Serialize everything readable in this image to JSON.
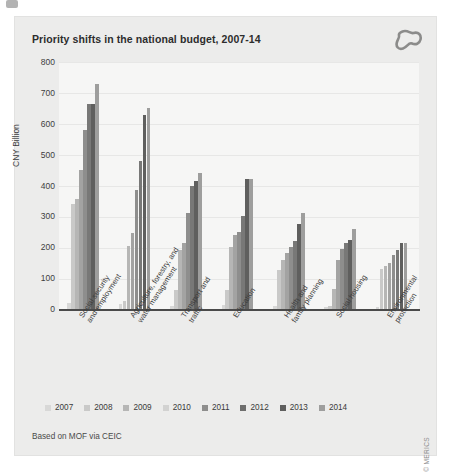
{
  "figure": {
    "title": "Priority shifts in the national budget, 2007-14",
    "source_note": "Based on MOF via CEIC",
    "copyright": "© MERICS",
    "logo_name": "merics-logo"
  },
  "chart_data": {
    "type": "bar",
    "title": "Priority shifts in the national budget, 2007-14",
    "xlabel": "",
    "ylabel": "CNY Billion",
    "ylim": [
      0,
      800
    ],
    "yticks": [
      0,
      100,
      200,
      300,
      400,
      500,
      600,
      700,
      800
    ],
    "grid": true,
    "legend_position": "bottom",
    "categories": [
      "Social security and employment",
      "Agriculture, forestry, and water management",
      "Transport and traffic",
      "Education",
      "Health and family planning",
      "Social housing",
      "Environmental protection"
    ],
    "series": [
      {
        "name": "2007",
        "color": "#d8d8d7",
        "values": [
          20,
          15,
          10,
          12,
          10,
          6,
          8
        ]
      },
      {
        "name": "2008",
        "color": "#c9c9c8",
        "values": [
          340,
          25,
          60,
          60,
          125,
          10,
          130
        ]
      },
      {
        "name": "2009",
        "color": "#b6b6b5",
        "values": [
          355,
          205,
          190,
          200,
          160,
          65,
          140
        ]
      },
      {
        "name": "2010",
        "color": "#a3a3a2",
        "values": [
          450,
          245,
          215,
          240,
          180,
          160,
          150
        ]
      },
      {
        "name": "2011",
        "color": "#8e8e8d",
        "values": [
          580,
          385,
          310,
          250,
          200,
          195,
          175
        ]
      },
      {
        "name": "2012",
        "color": "#787877",
        "values": [
          665,
          480,
          400,
          300,
          220,
          215,
          190
        ]
      },
      {
        "name": "2013",
        "color": "#5f5f5e",
        "values": [
          665,
          630,
          415,
          420,
          275,
          225,
          215
        ]
      },
      {
        "name": "2014",
        "color": "#9e9e9d",
        "values": [
          730,
          650,
          440,
          420,
          310,
          260,
          215
        ]
      }
    ]
  },
  "legend": {
    "items": [
      {
        "label": "2007",
        "color": "#d8d8d7"
      },
      {
        "label": "2008",
        "color": "#c9c9c8"
      },
      {
        "label": "2009",
        "color": "#b6b6b5"
      },
      {
        "label": "2010",
        "color": "#d2d2d1"
      },
      {
        "label": "2011",
        "color": "#8e8e8d"
      },
      {
        "label": "2012",
        "color": "#6e6e6d"
      },
      {
        "label": "2013",
        "color": "#5f5f5e"
      },
      {
        "label": "2014",
        "color": "#9e9e9d"
      }
    ]
  }
}
